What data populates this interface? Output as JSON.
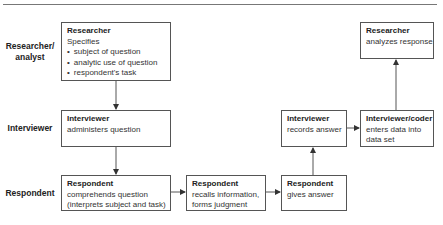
{
  "row_labels": {
    "researcher": [
      "Researcher/",
      "analyst"
    ],
    "interviewer": "Interviewer",
    "respondent": "Respondent"
  },
  "boxes": {
    "researcher_specifies": {
      "title": "Researcher",
      "lines": [
        "Specifies"
      ],
      "bullets": [
        "subject of question",
        "analytic use of question",
        "respondent's task"
      ]
    },
    "interviewer_administers": {
      "title": "Interviewer",
      "lines": [
        "administers question"
      ]
    },
    "respondent_comprehends": {
      "title": "Respondent",
      "lines": [
        "comprehends question",
        "(interprets subject and task)"
      ]
    },
    "respondent_recalls": {
      "title": "Respondent",
      "lines": [
        "recalls information,",
        "forms judgment"
      ]
    },
    "respondent_answers": {
      "title": "Respondent",
      "lines": [
        "gives answer"
      ]
    },
    "interviewer_records": {
      "title": "Interviewer",
      "lines": [
        "records answer"
      ]
    },
    "coder_enters": {
      "title": "Interviewer/coder",
      "lines": [
        "enters data into",
        "data set"
      ]
    },
    "researcher_analyzes": {
      "title": "Researcher",
      "lines": [
        "analyzes response"
      ]
    }
  },
  "colors": {
    "line": "#555555",
    "rule": "#777777",
    "text": "#222222"
  }
}
